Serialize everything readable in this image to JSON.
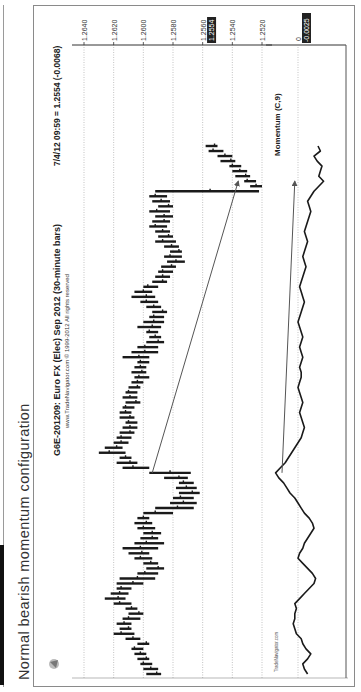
{
  "caption": "Normal bearish momentum configuration",
  "chart": {
    "title": "G6E-201209:  Euro FX (Elec) Sep 2012  (30-minute bars)",
    "copyright": "www.TradeNavigator.com © 1999-2012 All rights reserved",
    "last_quote": "7/4/12 09:59 = 1.2554 (-0.0068)",
    "current_price_tag": "1.2554",
    "indicator_label": "Momentum (C,9)",
    "indicator_zero_label": "0",
    "indicator_value_tag": "-0.0025",
    "watermark": "TradeNavigator.com",
    "accent_colors": {
      "bars": "#1a1a1a",
      "tag_bg": "#222222",
      "grid": "#9a9a9a",
      "arrow": "#555555"
    }
  },
  "chart_data": {
    "type": "ohlc",
    "title": "G6E-201209: Euro FX (Elec) Sep 2012 (30-minute bars)",
    "orientation_note": "figure rotated 90° counter-clockwise on page",
    "price_axis": {
      "ticks": [
        "1.2640",
        "1.2620",
        "1.2600",
        "1.2580",
        "1.2560",
        "1.2540",
        "1.2520"
      ],
      "range": [
        1.2515,
        1.2645
      ],
      "grid": true,
      "position": "right"
    },
    "current_price": 1.2554,
    "change": -0.0068,
    "bars_high_low": [
      [
        1.2598,
        1.2588
      ],
      [
        1.26,
        1.259
      ],
      [
        1.2602,
        1.2594
      ],
      [
        1.2604,
        1.2596
      ],
      [
        1.2606,
        1.2598
      ],
      [
        1.2608,
        1.26
      ],
      [
        1.2604,
        1.2596
      ],
      [
        1.2612,
        1.2602
      ],
      [
        1.262,
        1.2606
      ],
      [
        1.2616,
        1.2608
      ],
      [
        1.2618,
        1.2608
      ],
      [
        1.2614,
        1.2602
      ],
      [
        1.261,
        1.26
      ],
      [
        1.2612,
        1.2604
      ],
      [
        1.262,
        1.2608
      ],
      [
        1.2626,
        1.2612
      ],
      [
        1.2622,
        1.261
      ],
      [
        1.2618,
        1.2608
      ],
      [
        1.2618,
        1.26
      ],
      [
        1.2616,
        1.2592
      ],
      [
        1.2604,
        1.259
      ],
      [
        1.2598,
        1.2586
      ],
      [
        1.26,
        1.259
      ],
      [
        1.2606,
        1.2594
      ],
      [
        1.261,
        1.2596
      ],
      [
        1.2614,
        1.259
      ],
      [
        1.2606,
        1.2586
      ],
      [
        1.2602,
        1.259
      ],
      [
        1.26,
        1.2588
      ],
      [
        1.2604,
        1.2592
      ],
      [
        1.2606,
        1.2594
      ],
      [
        1.2604,
        1.2596
      ],
      [
        1.26,
        1.258
      ],
      [
        1.2592,
        1.2566
      ],
      [
        1.2582,
        1.2564
      ],
      [
        1.258,
        1.2566
      ],
      [
        1.2576,
        1.2562
      ],
      [
        1.2578,
        1.2564
      ],
      [
        1.2576,
        1.2566
      ],
      [
        1.2586,
        1.257
      ],
      [
        1.2596,
        1.2568
      ],
      [
        1.2614,
        1.2596
      ],
      [
        1.2618,
        1.2604
      ],
      [
        1.2616,
        1.2608
      ],
      [
        1.263,
        1.2612
      ],
      [
        1.2626,
        1.2614
      ],
      [
        1.262,
        1.261
      ],
      [
        1.2618,
        1.2608
      ],
      [
        1.2616,
        1.2606
      ],
      [
        1.2614,
        1.2604
      ],
      [
        1.2612,
        1.2604
      ],
      [
        1.2616,
        1.2606
      ],
      [
        1.2616,
        1.2608
      ],
      [
        1.2614,
        1.2606
      ],
      [
        1.2612,
        1.2602
      ],
      [
        1.2614,
        1.2604
      ],
      [
        1.2612,
        1.2604
      ],
      [
        1.261,
        1.2602
      ],
      [
        1.2608,
        1.26
      ],
      [
        1.2606,
        1.2596
      ],
      [
        1.2608,
        1.2598
      ],
      [
        1.2606,
        1.2598
      ],
      [
        1.2604,
        1.2596
      ],
      [
        1.2614,
        1.2596
      ],
      [
        1.2608,
        1.259
      ],
      [
        1.2604,
        1.259
      ],
      [
        1.2598,
        1.2586
      ],
      [
        1.2596,
        1.2588
      ],
      [
        1.2598,
        1.259
      ],
      [
        1.2604,
        1.2588
      ],
      [
        1.26,
        1.2586
      ],
      [
        1.2596,
        1.2586
      ],
      [
        1.2594,
        1.2584
      ],
      [
        1.2598,
        1.2588
      ],
      [
        1.2602,
        1.259
      ],
      [
        1.2608,
        1.2592
      ],
      [
        1.2606,
        1.2594
      ],
      [
        1.26,
        1.259
      ],
      [
        1.2594,
        1.2584
      ],
      [
        1.2592,
        1.2582
      ],
      [
        1.259,
        1.258
      ],
      [
        1.2588,
        1.2578
      ],
      [
        1.2584,
        1.2572
      ],
      [
        1.2586,
        1.2574
      ],
      [
        1.2582,
        1.2574
      ],
      [
        1.2586,
        1.2576
      ],
      [
        1.2592,
        1.2578
      ],
      [
        1.259,
        1.258
      ],
      [
        1.2592,
        1.2582
      ],
      [
        1.2596,
        1.2584
      ],
      [
        1.2594,
        1.2582
      ],
      [
        1.2592,
        1.258
      ],
      [
        1.2596,
        1.2582
      ],
      [
        1.259,
        1.258
      ],
      [
        1.2594,
        1.2582
      ],
      [
        1.2596,
        1.2584
      ],
      [
        1.2592,
        1.2522
      ],
      [
        1.2528,
        1.252
      ],
      [
        1.2532,
        1.2524
      ],
      [
        1.2538,
        1.2528
      ],
      [
        1.254,
        1.253
      ],
      [
        1.2542,
        1.2534
      ],
      [
        1.2548,
        1.2538
      ],
      [
        1.255,
        1.254
      ],
      [
        1.2556,
        1.2546
      ],
      [
        1.2558,
        1.255
      ]
    ],
    "price_arrow": {
      "from_index": 40,
      "from_price": 1.2594,
      "to_index": 98,
      "to_price": 1.2536,
      "label": "price lower low"
    },
    "momentum": {
      "label": "Momentum (C,9)",
      "zero_line": true,
      "last_value": -0.0025,
      "values": [
        -0.0012,
        -0.0008,
        -0.0006,
        -0.0012,
        -0.0016,
        -0.001,
        -0.0006,
        -0.0004,
        0.0002,
        0.0004,
        0.0006,
        0.0004,
        0.0004,
        0.0002,
        0.0004,
        -0.0002,
        -0.0008,
        -0.0014,
        -0.002,
        -0.0022,
        -0.0018,
        -0.0012,
        -0.0006,
        0.0,
        -0.0002,
        -0.0006,
        -0.0008,
        -0.0012,
        -0.0016,
        -0.002,
        -0.0018,
        -0.0014,
        -0.0008,
        -0.0004,
        0.0,
        0.0004,
        0.001,
        0.0014,
        0.0018,
        0.0024,
        0.0028,
        0.0022,
        0.0016,
        0.0012,
        0.0008,
        0.0004,
        0.0,
        -0.0004,
        -0.0006,
        -0.0008,
        -0.0006,
        -0.0004,
        -0.0002,
        -0.0004,
        -0.0006,
        -0.0004,
        -0.0002,
        0.0,
        -0.0002,
        -0.0004,
        -0.0004,
        -0.0002,
        -0.0004,
        -0.0006,
        -0.0004,
        -0.0002,
        -0.0004,
        -0.0006,
        -0.0004,
        -0.0002,
        0.0,
        -0.0002,
        -0.0004,
        -0.0006,
        -0.0008,
        -0.0006,
        -0.0004,
        -0.0002,
        -0.0004,
        -0.0006,
        -0.0008,
        -0.001,
        -0.0008,
        -0.0006,
        -0.0008,
        -0.001,
        -0.0012,
        -0.001,
        -0.0008,
        -0.001,
        -0.0012,
        -0.0014,
        -0.0016,
        -0.0014,
        -0.0012,
        -0.0016,
        -0.002,
        -0.0026,
        -0.0032,
        -0.0026,
        -0.0028,
        -0.003,
        -0.0024,
        -0.002,
        -0.0028,
        -0.0025
      ],
      "momentum_arrow": {
        "from_index": 40,
        "from_value": 0.002,
        "to_index": 98,
        "to_value": 0.0004,
        "label": "momentum lower low"
      }
    }
  }
}
